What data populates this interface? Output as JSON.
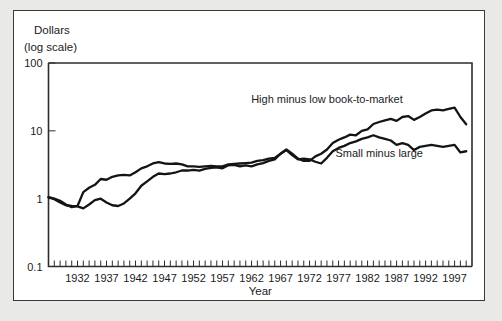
{
  "figure": {
    "y_axis_title_line1": "Dollars",
    "y_axis_title_line2": "(log scale)",
    "x_axis_title": "Year"
  },
  "chart_data": {
    "type": "line",
    "title": "",
    "subtitle": "",
    "xlabel": "Year",
    "ylabel": "Dollars (log scale)",
    "yscale": "log",
    "ylim": [
      0.1,
      100
    ],
    "ytick_labels": [
      "0.1",
      "1",
      "10",
      "100"
    ],
    "ytick_values": [
      0.1,
      1,
      10,
      100
    ],
    "xlim": [
      1927,
      2000
    ],
    "xtick_labels": [
      "1932",
      "1937",
      "1942",
      "1947",
      "1952",
      "1957",
      "1962",
      "1967",
      "1972",
      "1977",
      "1982",
      "1987",
      "1992",
      "1997"
    ],
    "xtick_values": [
      1932,
      1937,
      1942,
      1947,
      1952,
      1957,
      1962,
      1967,
      1972,
      1977,
      1982,
      1987,
      1992,
      1997
    ],
    "minor_ticks": "annual",
    "grid": false,
    "legend_position": "inline-annotation",
    "annotations": [
      {
        "text": "High minus low book-to-market",
        "x": 1975,
        "y": 26
      },
      {
        "text": "Small minus large",
        "x": 1984,
        "y": 4.1
      }
    ],
    "x": [
      1927,
      1928,
      1929,
      1930,
      1931,
      1932,
      1933,
      1934,
      1935,
      1936,
      1937,
      1938,
      1939,
      1940,
      1941,
      1942,
      1943,
      1944,
      1945,
      1946,
      1947,
      1948,
      1949,
      1950,
      1951,
      1952,
      1953,
      1954,
      1955,
      1956,
      1957,
      1958,
      1959,
      1960,
      1961,
      1962,
      1963,
      1964,
      1965,
      1966,
      1967,
      1968,
      1969,
      1970,
      1971,
      1972,
      1973,
      1974,
      1975,
      1976,
      1977,
      1978,
      1979,
      1980,
      1981,
      1982,
      1983,
      1984,
      1985,
      1986,
      1987,
      1988,
      1989,
      1990,
      1991,
      1992,
      1993,
      1994,
      1995,
      1996,
      1997,
      1998,
      1999
    ],
    "series": [
      {
        "name": "High minus low book-to-market",
        "values": [
          1.05,
          1.0,
          0.93,
          0.82,
          0.75,
          0.78,
          1.25,
          1.45,
          1.6,
          1.95,
          1.9,
          2.1,
          2.2,
          2.25,
          2.2,
          2.45,
          2.8,
          3.0,
          3.3,
          3.45,
          3.3,
          3.25,
          3.3,
          3.2,
          3.0,
          3.0,
          2.95,
          3.0,
          3.05,
          3.0,
          3.0,
          3.2,
          3.25,
          3.3,
          3.35,
          3.4,
          3.6,
          3.7,
          3.9,
          4.0,
          4.6,
          5.3,
          4.6,
          3.9,
          3.6,
          3.6,
          4.2,
          4.6,
          5.3,
          6.6,
          7.4,
          8.0,
          8.8,
          8.6,
          10.0,
          10.5,
          12.6,
          13.5,
          14.3,
          15.0,
          14.0,
          16.0,
          16.5,
          14.5,
          16.0,
          18.0,
          20.0,
          20.5,
          20.0,
          21.0,
          22.0,
          16.0,
          12.5
        ]
      },
      {
        "name": "Small minus large",
        "values": [
          1.05,
          0.98,
          0.88,
          0.8,
          0.78,
          0.77,
          0.72,
          0.82,
          0.95,
          1.0,
          0.88,
          0.8,
          0.78,
          0.85,
          1.0,
          1.2,
          1.55,
          1.8,
          2.1,
          2.35,
          2.3,
          2.35,
          2.45,
          2.6,
          2.6,
          2.65,
          2.6,
          2.75,
          2.85,
          2.9,
          2.8,
          3.1,
          3.15,
          3.0,
          3.1,
          3.0,
          3.2,
          3.35,
          3.6,
          3.8,
          4.6,
          5.2,
          4.4,
          3.8,
          3.9,
          3.8,
          3.5,
          3.3,
          4.0,
          5.0,
          5.6,
          6.0,
          6.6,
          7.0,
          7.6,
          8.0,
          8.6,
          8.0,
          7.6,
          7.2,
          6.2,
          6.6,
          6.2,
          5.2,
          5.8,
          6.0,
          6.2,
          6.0,
          5.8,
          6.0,
          6.2,
          4.8,
          5.0
        ]
      }
    ]
  }
}
